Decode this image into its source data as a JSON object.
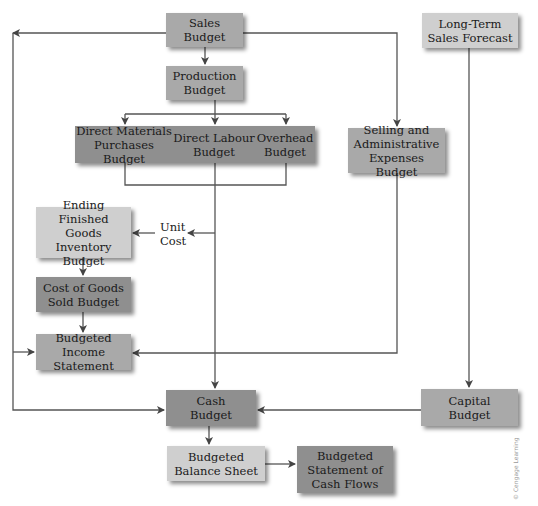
{
  "diagram": {
    "boxes": {
      "sales_budget": "Sales\nBudget",
      "long_term_forecast": "Long-Term\nSales Forecast",
      "production_budget": "Production\nBudget",
      "direct_materials": "Direct Materials\nPurchases Budget",
      "direct_labour": "Direct Labour\nBudget",
      "overhead": "Overhead\nBudget",
      "selling_admin": "Selling and\nAdministrative\nExpenses Budget",
      "ending_finished_goods": "Ending Finished\nGoods Inventory\nBudget",
      "cost_of_goods_sold": "Cost of Goods\nSold Budget",
      "budgeted_income": "Budgeted Income\nStatement",
      "cash_budget": "Cash\nBudget",
      "capital_budget": "Capital\nBudget",
      "balance_sheet": "Budgeted\nBalance Sheet",
      "cash_flows": "Budgeted\nStatement of\nCash Flows"
    },
    "labels": {
      "unit_cost": "Unit\nCost"
    },
    "watermark": "© Cengage Learning",
    "colors": {
      "line": "#555555",
      "box_mid": "#a9a9a9",
      "box_dark": "#8f8f8f",
      "box_light": "#cfcfcf"
    }
  }
}
